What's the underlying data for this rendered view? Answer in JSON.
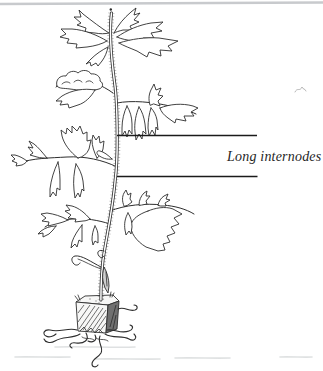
{
  "figure": {
    "caption_label": "Long internodes",
    "illustration_name": "leggy-seedling-with-long-internodes-in-soil-block",
    "colors": {
      "background": "#ffffff",
      "ink": "#2e2e2e",
      "top_rule": "#c8cacd",
      "annotation_line": "#1b1b1b",
      "label_text": "#1f1f1f",
      "soil_shade": "#707070"
    }
  }
}
